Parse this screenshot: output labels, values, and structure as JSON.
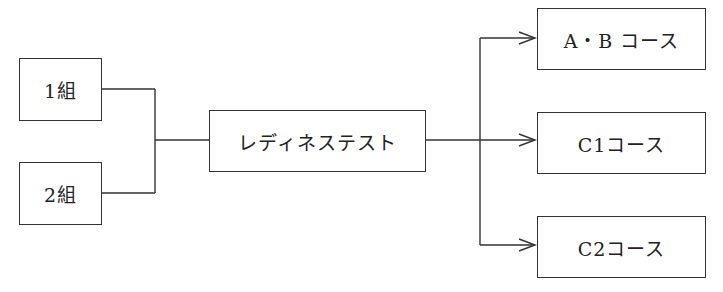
{
  "diagram": {
    "type": "flow",
    "inputs": [
      {
        "label": "1組"
      },
      {
        "label": "2組"
      }
    ],
    "center": {
      "label": "レディネステスト"
    },
    "outputs": [
      {
        "label": "A・B コース"
      },
      {
        "label": "C1コース"
      },
      {
        "label": "C2コース"
      }
    ],
    "edges": [
      {
        "from": "1組",
        "to": "レディネステスト",
        "arrow": false
      },
      {
        "from": "2組",
        "to": "レディネステスト",
        "arrow": false
      },
      {
        "from": "レディネステスト",
        "to": "A・B コース",
        "arrow": true
      },
      {
        "from": "レディネステスト",
        "to": "C1コース",
        "arrow": true
      },
      {
        "from": "レディネステスト",
        "to": "C2コース",
        "arrow": true
      }
    ],
    "colors": {
      "stroke": "#333333",
      "background": "#ffffff",
      "text": "#222222"
    }
  }
}
